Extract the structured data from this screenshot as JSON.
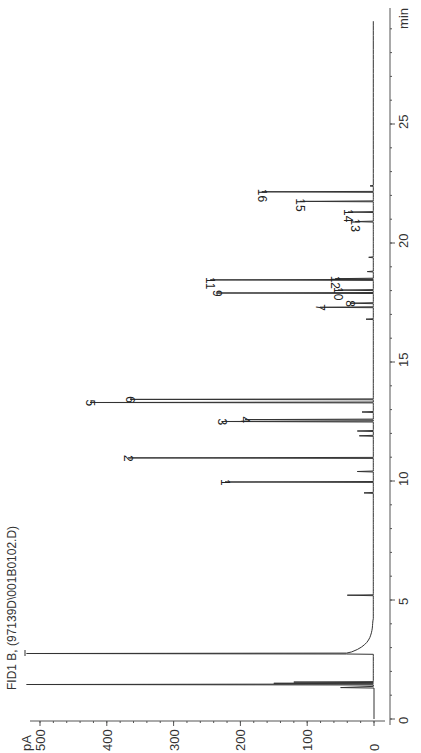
{
  "chart_data": {
    "type": "line",
    "title": "FID1 B,  (97139D\\001B0102.D)",
    "xlabel": "min",
    "ylabel": "pA",
    "orientation": "rotated-90-ccw",
    "xlim": [
      0,
      29.5
    ],
    "ylim": [
      0,
      500
    ],
    "x_ticks": [
      0,
      5,
      10,
      15,
      20,
      25
    ],
    "y_ticks": [
      0,
      100,
      200,
      300,
      400,
      500
    ],
    "grid": false,
    "legend": null,
    "baseline_pA": 1,
    "off_scale_peaks": [
      {
        "time_min": 1.45,
        "height_pA": 520,
        "note": "off-scale, initial detector response"
      },
      {
        "time_min": 2.75,
        "height_pA": 520,
        "note": "off-scale solvent peak"
      }
    ],
    "minor_peaks": [
      {
        "time_min": 1.5,
        "height_pA": 150
      },
      {
        "time_min": 1.55,
        "height_pA": 120
      },
      {
        "time_min": 5.2,
        "height_pA": 40
      },
      {
        "time_min": 9.5,
        "height_pA": 15
      },
      {
        "time_min": 10.4,
        "height_pA": 25
      },
      {
        "time_min": 11.9,
        "height_pA": 22
      },
      {
        "time_min": 12.1,
        "height_pA": 25
      },
      {
        "time_min": 12.9,
        "height_pA": 18
      },
      {
        "time_min": 16.8,
        "height_pA": 12
      },
      {
        "time_min": 18.8,
        "height_pA": 10
      },
      {
        "time_min": 19.4,
        "height_pA": 8
      },
      {
        "time_min": 22.4,
        "height_pA": 6
      }
    ],
    "peaks": [
      {
        "label": "1",
        "time_min": 9.96,
        "height_pA": 223
      },
      {
        "label": "2",
        "time_min": 10.97,
        "height_pA": 368
      },
      {
        "label": "3",
        "time_min": 12.5,
        "height_pA": 228
      },
      {
        "label": "4",
        "time_min": 12.58,
        "height_pA": 193
      },
      {
        "label": "5",
        "time_min": 13.3,
        "height_pA": 425
      },
      {
        "label": "6",
        "time_min": 13.43,
        "height_pA": 365
      },
      {
        "label": "7",
        "time_min": 17.3,
        "height_pA": 81
      },
      {
        "label": "8",
        "time_min": 17.47,
        "height_pA": 36
      },
      {
        "label": "9",
        "time_min": 17.9,
        "height_pA": 235
      },
      {
        "label": "10",
        "time_min": 18.02,
        "height_pA": 54
      },
      {
        "label": "11",
        "time_min": 18.45,
        "height_pA": 245
      },
      {
        "label": "12",
        "time_min": 18.5,
        "height_pA": 58
      },
      {
        "label": "13",
        "time_min": 20.9,
        "height_pA": 28
      },
      {
        "label": "14",
        "time_min": 21.3,
        "height_pA": 39
      },
      {
        "label": "15",
        "time_min": 21.75,
        "height_pA": 111
      },
      {
        "label": "16",
        "time_min": 22.15,
        "height_pA": 168
      }
    ]
  },
  "colors": {
    "trace": "#333333",
    "axis": "#555555",
    "background": "#ffffff"
  }
}
